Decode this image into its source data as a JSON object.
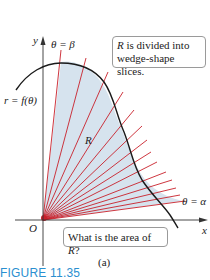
{
  "figure": {
    "caption": "FIGURE 11.35",
    "subfigure_label": "(a)",
    "colors": {
      "region_fill": "#d6e3ee",
      "ray": "#c8202a",
      "curve": "#1a1a1a",
      "axis": "#333333",
      "caption": "#2a8fd0"
    }
  },
  "axes": {
    "x_label": "x",
    "y_label": "y",
    "origin_label": "O"
  },
  "labels": {
    "curve": "r = f(θ)",
    "theta_beta": "θ = β",
    "theta_alpha": "θ = α",
    "region": "R"
  },
  "callouts": {
    "top_pre": "R",
    "top_rest_line1": " is divided into",
    "top_line2": "wedge-shape slices.",
    "bottom_pre": "What is the area of ",
    "bottom_R": "R",
    "bottom_post": "?"
  },
  "rays": {
    "count": 14,
    "origin": [
      43,
      220
    ]
  }
}
